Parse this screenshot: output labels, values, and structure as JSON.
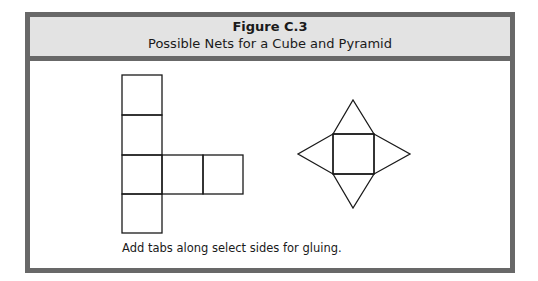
{
  "figure": {
    "title": "Figure C.3",
    "subtitle": "Possible Nets for a Cube and Pyramid",
    "caption": "Add tabs along select sides for gluing."
  },
  "colors": {
    "border": "#686868",
    "header_background": "#e3e3e3",
    "line": "#1a1a1a"
  },
  "diagrams": [
    {
      "name": "cube-net",
      "description": "Six squares arranged in a cross/T shape: vertical column of four squares with two squares extending right from the third"
    },
    {
      "name": "pyramid-net",
      "description": "Central square with four triangles attached on each side"
    }
  ]
}
